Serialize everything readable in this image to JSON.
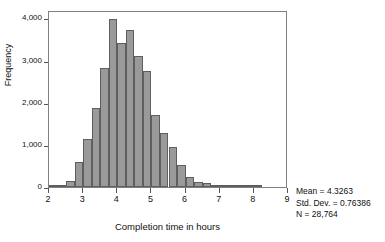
{
  "chart_data": {
    "type": "bar",
    "title": "",
    "xlabel": "Completion time in hours",
    "ylabel": "Frequency",
    "xlim": [
      2,
      9
    ],
    "ylim": [
      0,
      4200
    ],
    "bin_width": 0.25,
    "grid": false,
    "legend": "none",
    "xticks": [
      "2",
      "3",
      "4",
      "5",
      "6",
      "7",
      "8",
      "9"
    ],
    "xtick_values": [
      2,
      3,
      4,
      5,
      6,
      7,
      8,
      9
    ],
    "yticks": [
      "0",
      "1,000",
      "2,000",
      "3,000",
      "4,000"
    ],
    "ytick_values": [
      0,
      1000,
      2000,
      3000,
      4000
    ],
    "bin_starts": [
      2.0,
      2.25,
      2.5,
      2.75,
      3.0,
      3.25,
      3.5,
      3.75,
      4.0,
      4.25,
      4.5,
      4.75,
      5.0,
      5.25,
      5.5,
      5.75,
      6.0,
      6.25,
      6.5,
      6.75,
      7.0,
      7.25,
      7.5,
      7.75,
      8.0
    ],
    "values": [
      15,
      40,
      150,
      590,
      1150,
      1880,
      2820,
      3990,
      3420,
      3730,
      3110,
      2760,
      1710,
      1290,
      940,
      520,
      240,
      125,
      100,
      40,
      25,
      12,
      8,
      4,
      2
    ],
    "bars": [
      {
        "x0": 2.0,
        "x1": 2.25,
        "value": 15
      },
      {
        "x0": 2.25,
        "x1": 2.5,
        "value": 40
      },
      {
        "x0": 2.5,
        "x1": 2.75,
        "value": 150
      },
      {
        "x0": 2.75,
        "x1": 3.0,
        "value": 590
      },
      {
        "x0": 3.0,
        "x1": 3.25,
        "value": 1150
      },
      {
        "x0": 3.25,
        "x1": 3.5,
        "value": 1880
      },
      {
        "x0": 3.5,
        "x1": 3.75,
        "value": 2820
      },
      {
        "x0": 3.75,
        "x1": 4.0,
        "value": 3990
      },
      {
        "x0": 4.0,
        "x1": 4.25,
        "value": 3420
      },
      {
        "x0": 4.25,
        "x1": 4.5,
        "value": 3730
      },
      {
        "x0": 4.5,
        "x1": 4.75,
        "value": 3110
      },
      {
        "x0": 4.75,
        "x1": 5.0,
        "value": 2760
      },
      {
        "x0": 5.0,
        "x1": 5.25,
        "value": 1710
      },
      {
        "x0": 5.25,
        "x1": 5.5,
        "value": 1290
      },
      {
        "x0": 5.5,
        "x1": 5.75,
        "value": 940
      },
      {
        "x0": 5.75,
        "x1": 6.0,
        "value": 520
      },
      {
        "x0": 6.0,
        "x1": 6.25,
        "value": 240
      },
      {
        "x0": 6.25,
        "x1": 6.5,
        "value": 125
      },
      {
        "x0": 6.5,
        "x1": 6.75,
        "value": 100
      },
      {
        "x0": 6.75,
        "x1": 7.0,
        "value": 40
      },
      {
        "x0": 7.0,
        "x1": 7.25,
        "value": 25
      },
      {
        "x0": 7.25,
        "x1": 7.5,
        "value": 12
      },
      {
        "x0": 7.5,
        "x1": 7.75,
        "value": 8
      },
      {
        "x0": 7.75,
        "x1": 8.0,
        "value": 4
      },
      {
        "x0": 8.0,
        "x1": 8.25,
        "value": 2
      }
    ],
    "annotations": {
      "mean": "Mean = 4.3263",
      "std_dev": "Std. Dev. = 0.76386",
      "n": "N = 28,764"
    }
  },
  "style": {
    "bar_fill": "#9a9a9a",
    "bar_stroke": "#5e5e5e",
    "frame_stroke": "#808080",
    "text_color": "#111111",
    "background": "#ffffff"
  }
}
